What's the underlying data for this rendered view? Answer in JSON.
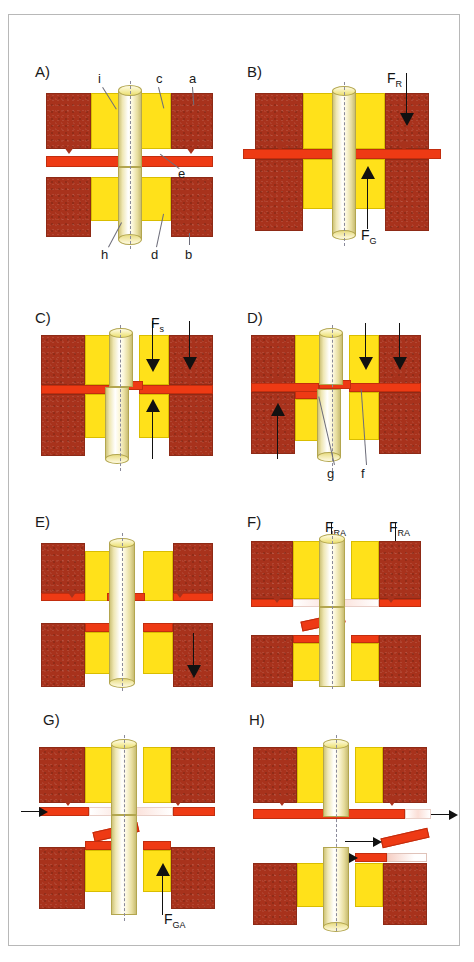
{
  "figure": {
    "panel_count": 8,
    "colors": {
      "block": "#a8321c",
      "collar": "#ffe11a",
      "plate": "#ee3a14",
      "pin": "#efe7b4",
      "arrow": "#111111",
      "axis": "#8a8a9a",
      "frame": "#b8b8b8"
    }
  },
  "panels": [
    {
      "id": "A",
      "label": "A)",
      "callouts": [
        {
          "key": "i",
          "text": "i"
        },
        {
          "key": "c",
          "text": "c"
        },
        {
          "key": "a",
          "text": "a"
        },
        {
          "key": "e",
          "text": "e"
        },
        {
          "key": "h",
          "text": "h"
        },
        {
          "key": "d",
          "text": "d"
        },
        {
          "key": "b",
          "text": "b"
        }
      ],
      "forces": []
    },
    {
      "id": "B",
      "label": "B)",
      "callouts": [],
      "forces": [
        {
          "key": "FR",
          "base": "F",
          "sub": "R",
          "direction": "down"
        },
        {
          "key": "FG",
          "base": "F",
          "sub": "G",
          "direction": "up"
        }
      ]
    },
    {
      "id": "C",
      "label": "C)",
      "callouts": [],
      "forces": [
        {
          "key": "Fs",
          "base": "F",
          "sub": "s",
          "direction": "down"
        }
      ]
    },
    {
      "id": "D",
      "label": "D)",
      "callouts": [
        {
          "key": "g",
          "text": "g"
        },
        {
          "key": "f",
          "text": "f"
        }
      ],
      "forces": []
    },
    {
      "id": "E",
      "label": "E)",
      "callouts": [],
      "forces": []
    },
    {
      "id": "F",
      "label": "F)",
      "callouts": [],
      "forces": [
        {
          "key": "FRA1",
          "base": "F",
          "sub": "RA",
          "direction": "down"
        },
        {
          "key": "FRA2",
          "base": "F",
          "sub": "RA",
          "direction": "down"
        }
      ]
    },
    {
      "id": "G",
      "label": "G)",
      "callouts": [],
      "forces": [
        {
          "key": "FGA",
          "base": "F",
          "sub": "GA",
          "direction": "up"
        }
      ]
    },
    {
      "id": "H",
      "label": "H)",
      "callouts": [],
      "forces": []
    }
  ],
  "legend": {
    "a": "a",
    "b": "b",
    "c": "c",
    "d": "d",
    "e": "e",
    "f": "f",
    "g": "g",
    "h": "h",
    "i": "i"
  }
}
